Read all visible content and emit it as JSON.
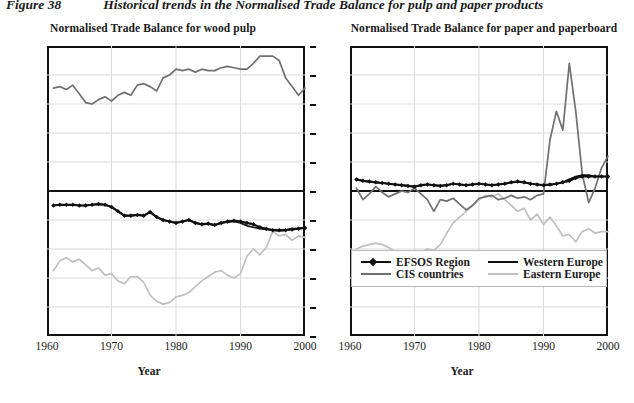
{
  "figure": {
    "number": "Figure 38",
    "title": "Historical trends in the Normalised Trade Balance for pulp and paper products"
  },
  "colors": {
    "efsos": "#111111",
    "western_europe": "#111111",
    "cis": "#707070",
    "eastern_europe": "#c0c0c0",
    "axis": "#111111",
    "grid": "#d9d9d9"
  },
  "legend": {
    "items": [
      {
        "label": "EFSOS Region",
        "color": "#111111",
        "marker": true
      },
      {
        "label": "Western Europe",
        "color": "#111111",
        "marker": false
      },
      {
        "label": "CIS countries",
        "color": "#707070",
        "marker": false
      },
      {
        "label": "Eastern Europe",
        "color": "#c0c0c0",
        "marker": false
      }
    ]
  },
  "chart_data": [
    {
      "id": "wood-pulp",
      "type": "line",
      "title": "Normalised Trade Balance for wood pulp",
      "xlabel": "Year",
      "ylabel": "",
      "xlim": [
        1960,
        2000
      ],
      "ylim": [
        -100,
        100
      ],
      "xticks": [
        1960,
        1970,
        1980,
        1990,
        2000
      ],
      "yticks": [
        100,
        80,
        60,
        40,
        20,
        0,
        -20,
        -40,
        -60,
        -80,
        -100
      ],
      "ytick_labels": [
        "100%",
        "80%",
        "60%",
        "40%",
        "20%",
        "0%",
        "-20%",
        "-40%",
        "-60%",
        "-80%",
        "-100%"
      ],
      "grid": true,
      "legend_position": "none",
      "x": [
        1961,
        1962,
        1963,
        1964,
        1965,
        1966,
        1967,
        1968,
        1969,
        1970,
        1971,
        1972,
        1973,
        1974,
        1975,
        1976,
        1977,
        1978,
        1979,
        1980,
        1981,
        1982,
        1983,
        1984,
        1985,
        1986,
        1987,
        1988,
        1989,
        1990,
        1991,
        1992,
        1993,
        1994,
        1995,
        1996,
        1997,
        1998,
        1999,
        2000
      ],
      "series": [
        {
          "name": "EFSOS Region",
          "color": "#111111",
          "values": [
            -10,
            -9.5,
            -9.5,
            -9.5,
            -10,
            -10,
            -9.5,
            -9,
            -9.5,
            -11,
            -14,
            -17,
            -17,
            -16.5,
            -17,
            -14.5,
            -18,
            -20,
            -21,
            -22,
            -21,
            -20,
            -22,
            -23,
            -22.5,
            -23.5,
            -22,
            -21,
            -20.5,
            -21,
            -22,
            -23,
            -25,
            -26,
            -27,
            -27,
            -27,
            -26.5,
            -26,
            -25.5
          ]
        },
        {
          "name": "Western Europe",
          "color": "#111111",
          "values": [
            -10,
            -9.5,
            -9.5,
            -9.5,
            -10,
            -10,
            -9.5,
            -9,
            -9.5,
            -11,
            -14,
            -17,
            -17,
            -16.5,
            -17,
            -14.5,
            -18,
            -20,
            -21,
            -22,
            -21,
            -20,
            -22,
            -23,
            -22.5,
            -23.5,
            -22,
            -21.5,
            -21,
            -22,
            -24,
            -25,
            -26,
            -26.5,
            -27,
            -27.5,
            -27,
            -26,
            -26,
            -25
          ]
        },
        {
          "name": "CIS countries",
          "color": "#707070",
          "values": [
            71,
            72,
            70,
            73,
            67,
            61,
            60,
            63,
            65,
            62,
            66,
            68,
            66,
            73,
            74,
            72,
            69,
            78,
            80,
            84,
            83,
            84,
            82,
            84,
            83,
            83,
            85,
            86,
            85,
            84,
            84,
            88,
            93,
            93,
            93,
            90,
            78,
            72,
            66,
            71
          ]
        },
        {
          "name": "Eastern Europe",
          "color": "#c0c0c0",
          "values": [
            -55,
            -48,
            -46,
            -49,
            -47,
            -51,
            -55,
            -53,
            -58,
            -57,
            -62,
            -64,
            -59,
            -59,
            -63,
            -72,
            -76,
            -78,
            -77,
            -73,
            -72,
            -70,
            -66,
            -62,
            -59,
            -56,
            -55,
            -58,
            -60,
            -57,
            -45,
            -40,
            -44,
            -39,
            -28,
            -31,
            -30,
            -34,
            -31,
            -32
          ]
        }
      ]
    },
    {
      "id": "paper-paperboard",
      "type": "line",
      "title": "Normalised Trade Balance for paper and paperboard",
      "xlabel": "Year",
      "ylabel": "",
      "xlim": [
        1960,
        2000
      ],
      "ylim": [
        -100,
        100
      ],
      "xticks": [
        1960,
        1970,
        1980,
        1990,
        2000
      ],
      "yticks": [
        100,
        80,
        60,
        40,
        20,
        0,
        -20,
        -40,
        -60,
        -80,
        -100
      ],
      "ytick_labels": [
        "",
        "",
        "",
        "",
        "",
        "",
        "",
        "",
        "",
        "",
        ""
      ],
      "grid": true,
      "legend_position": "bottom",
      "x": [
        1961,
        1962,
        1963,
        1964,
        1965,
        1966,
        1967,
        1968,
        1969,
        1970,
        1971,
        1972,
        1973,
        1974,
        1975,
        1976,
        1977,
        1978,
        1979,
        1980,
        1981,
        1982,
        1983,
        1984,
        1985,
        1986,
        1987,
        1988,
        1989,
        1990,
        1991,
        1992,
        1993,
        1994,
        1995,
        1996,
        1997,
        1998,
        1999,
        2000
      ],
      "series": [
        {
          "name": "EFSOS Region",
          "color": "#111111",
          "values": [
            8,
            7,
            6.5,
            6,
            5.5,
            5,
            4.5,
            4,
            3.5,
            3,
            4,
            4.5,
            4,
            3.5,
            4,
            5,
            4.5,
            4,
            4.5,
            5,
            4.5,
            4,
            4.5,
            5,
            6,
            6.5,
            6,
            5,
            4.5,
            4,
            4.5,
            5,
            6,
            7,
            9,
            10,
            10,
            10,
            10,
            10
          ]
        },
        {
          "name": "Western Europe",
          "color": "#111111",
          "values": [
            8,
            7,
            6.5,
            6,
            5.5,
            5,
            4.5,
            4,
            3.5,
            3,
            4,
            4.5,
            4,
            3.5,
            4,
            5,
            4.5,
            4,
            4.5,
            5,
            4.5,
            4,
            4.5,
            5,
            6,
            6.5,
            6,
            5,
            4.5,
            4,
            4,
            5,
            6,
            8,
            10,
            11,
            11,
            10,
            10,
            10
          ]
        },
        {
          "name": "CIS countries",
          "color": "#707070",
          "values": [
            2,
            -6,
            -2,
            3,
            -1,
            -4,
            -2,
            0,
            -1,
            2,
            -2,
            -6,
            -14,
            -6,
            -7,
            -5,
            -9,
            -13,
            -10,
            -5,
            -4,
            -3,
            -6,
            -5,
            -3,
            -5,
            -4,
            -6,
            -3,
            -2,
            35,
            55,
            42,
            88,
            55,
            12,
            -8,
            2,
            16,
            24
          ]
        },
        {
          "name": "Eastern Europe",
          "color": "#c0c0c0",
          "values": [
            -40,
            -38,
            -37,
            -36,
            -37,
            -39,
            -42,
            -44,
            -47,
            -46,
            -42,
            -40,
            -41,
            -37,
            -29,
            -22,
            -18,
            -14,
            -10,
            -6,
            -3,
            -4,
            -2,
            -6,
            -10,
            -14,
            -12,
            -20,
            -16,
            -23,
            -18,
            -24,
            -31,
            -30,
            -35,
            -28,
            -26,
            -29,
            -28,
            -28
          ]
        }
      ]
    }
  ]
}
